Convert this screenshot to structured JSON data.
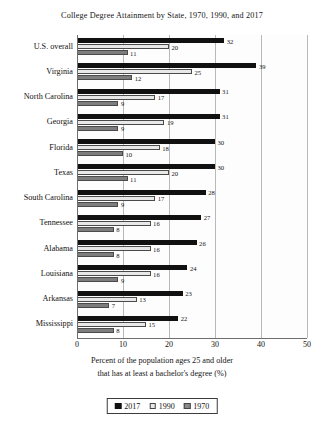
{
  "chart_data": {
    "type": "bar",
    "orientation": "horizontal",
    "title": "College Degree Attainment by State, 1970, 1990, and 2017",
    "xlabel_line1": "Percent of the population ages 25 and older",
    "xlabel_line2": "that has at least a bachelor's degree (%)",
    "ylabel": "",
    "xlim": [
      0,
      50
    ],
    "xticks": [
      0,
      10,
      20,
      30,
      40,
      50
    ],
    "xtick_labels": [
      "0",
      "10",
      "20",
      "30",
      "40",
      "50"
    ],
    "grid": true,
    "grid_axis": "x",
    "legend_position": "bottom",
    "categories": [
      "U.S. overall",
      "Virginia",
      "North Carolina",
      "Georgia",
      "Florida",
      "Texas",
      "South Carolina",
      "Tennessee",
      "Alabama",
      "Louisiana",
      "Arkansas",
      "Mississippi"
    ],
    "series": [
      {
        "name": "2017",
        "color": "#111111",
        "values": [
          32,
          39,
          31,
          31,
          30,
          30,
          28,
          27,
          26,
          24,
          23,
          22
        ]
      },
      {
        "name": "1990",
        "color": "#e8e8e8",
        "values": [
          20,
          25,
          17,
          19,
          18,
          20,
          17,
          16,
          16,
          16,
          13,
          15
        ]
      },
      {
        "name": "1970",
        "color": "#7d7d7d",
        "values": [
          11,
          12,
          9,
          9,
          10,
          11,
          9,
          8,
          8,
          9,
          7,
          8
        ]
      }
    ],
    "legend": [
      "2017",
      "1990",
      "1970"
    ]
  }
}
